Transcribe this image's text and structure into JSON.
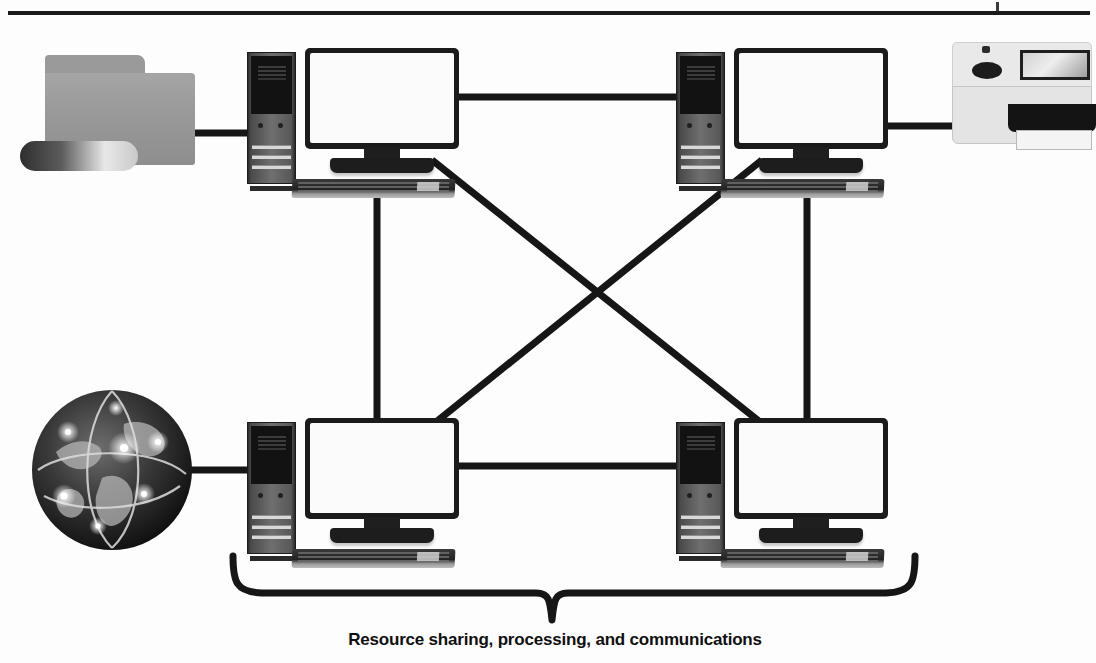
{
  "diagram": {
    "caption": "Resource sharing, processing, and communications",
    "background_color": "#fdfdfd",
    "line_color": "#161616",
    "nodes": [
      {
        "id": "folder",
        "type": "file-storage",
        "label": "Shared files folder",
        "x": 20,
        "y": 55
      },
      {
        "id": "pc-top-left",
        "type": "workstation",
        "label": "Computer 1",
        "x": 247,
        "y": 48
      },
      {
        "id": "pc-top-right",
        "type": "workstation",
        "label": "Computer 2",
        "x": 676,
        "y": 48
      },
      {
        "id": "printer",
        "type": "printer",
        "label": "Shared printer",
        "x": 946,
        "y": 36
      },
      {
        "id": "globe",
        "type": "internet",
        "label": "Internet",
        "x": 28,
        "y": 386
      },
      {
        "id": "pc-bottom-left",
        "type": "workstation",
        "label": "Computer 3",
        "x": 247,
        "y": 418
      },
      {
        "id": "pc-bottom-right",
        "type": "workstation",
        "label": "Computer 4",
        "x": 676,
        "y": 418
      }
    ],
    "links": [
      {
        "from": "folder",
        "to": "pc-top-left",
        "kind": "straight"
      },
      {
        "from": "pc-top-left",
        "to": "pc-top-right",
        "kind": "straight"
      },
      {
        "from": "pc-top-right",
        "to": "printer",
        "kind": "straight"
      },
      {
        "from": "globe",
        "to": "pc-bottom-left",
        "kind": "straight"
      },
      {
        "from": "pc-bottom-left",
        "to": "pc-bottom-right",
        "kind": "straight"
      },
      {
        "from": "pc-top-left",
        "to": "pc-bottom-left",
        "kind": "vertical"
      },
      {
        "from": "pc-top-right",
        "to": "pc-bottom-right",
        "kind": "vertical"
      },
      {
        "from": "pc-top-left",
        "to": "pc-bottom-right",
        "kind": "diagonal"
      },
      {
        "from": "pc-top-right",
        "to": "pc-bottom-left",
        "kind": "diagonal"
      }
    ],
    "brace": {
      "label": "Resource sharing, processing, and communications",
      "left_x": 233,
      "right_x": 915,
      "point_x": 552
    }
  }
}
